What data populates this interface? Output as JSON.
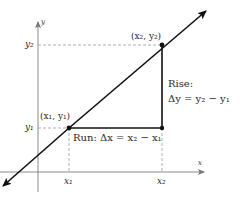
{
  "diagram": {
    "type": "slope-rise-run",
    "colors": {
      "line": "#111111",
      "axis": "#9a9a9a",
      "dashed": "#9a9a9a",
      "text": "#2a2a2a",
      "background": "#ffffff"
    },
    "axes": {
      "x_label": "x",
      "y_label": "y"
    },
    "ticks": {
      "x1": "x₁",
      "x2": "x₂",
      "y1": "y₁",
      "y2": "y₂"
    },
    "points": {
      "p1_label": "(x₁, y₁)",
      "p2_label": "(x₂, y₂)"
    },
    "rise": {
      "title": "Rise:",
      "formula": "Δy = y₂ − y₁"
    },
    "run": {
      "label": "Run: Δx = x₂ − x₁"
    }
  }
}
